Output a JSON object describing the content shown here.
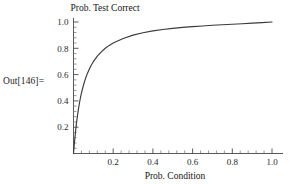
{
  "cell": {
    "out_label": "Out[146]="
  },
  "chart_data": {
    "type": "line",
    "title": "",
    "ylabel": "Prob. Test Correct",
    "xlabel": "Prob. Condition",
    "xlim": [
      0.0,
      1.0
    ],
    "ylim": [
      0.0,
      1.04
    ],
    "grid": false,
    "legend": null,
    "x_ticks": [
      "0.2",
      "0.4",
      "0.6",
      "0.8",
      "1.0"
    ],
    "x_tick_values": [
      0.2,
      0.4,
      0.6,
      0.8,
      1.0
    ],
    "x_minor_tick_count_per_interval": 4,
    "y_ticks": [
      "0.2",
      "0.4",
      "0.6",
      "0.8",
      "1.0"
    ],
    "y_tick_values": [
      0.2,
      0.4,
      0.6,
      0.8,
      1.0
    ],
    "y_minor_tick_count_per_interval": 4,
    "series": [
      {
        "name": "Prob. Test Correct",
        "color": "#3a3a3a",
        "x": [
          0.0,
          0.002,
          0.005,
          0.008,
          0.01,
          0.013,
          0.016,
          0.02,
          0.025,
          0.03,
          0.035,
          0.04,
          0.05,
          0.06,
          0.07,
          0.08,
          0.09,
          0.1,
          0.12,
          0.14,
          0.16,
          0.18,
          0.2,
          0.25,
          0.3,
          0.35,
          0.4,
          0.45,
          0.5,
          0.55,
          0.6,
          0.65,
          0.7,
          0.75,
          0.8,
          0.85,
          0.9,
          0.95,
          1.0
        ],
        "y": [
          0.0,
          0.036,
          0.087,
          0.134,
          0.163,
          0.204,
          0.242,
          0.288,
          0.339,
          0.384,
          0.424,
          0.459,
          0.519,
          0.568,
          0.609,
          0.643,
          0.673,
          0.698,
          0.74,
          0.773,
          0.8,
          0.822,
          0.84,
          0.875,
          0.9,
          0.918,
          0.932,
          0.943,
          0.952,
          0.959,
          0.965,
          0.97,
          0.975,
          0.979,
          0.983,
          0.987,
          0.991,
          0.995,
          1.0
        ]
      }
    ]
  }
}
